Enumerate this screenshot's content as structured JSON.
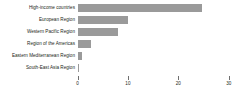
{
  "chart_data": {
    "type": "bar",
    "orientation": "horizontal",
    "title": "",
    "subtitle": "",
    "xlabel": "",
    "ylabel": "",
    "categories": [
      "High-income countries",
      "European Region",
      "Western Pacific Region",
      "Region of the Americas",
      "Eastern Mediterranean Region",
      "South-East Asia Region"
    ],
    "values": [
      24.8,
      10.0,
      8.0,
      2.7,
      0.8,
      0.3
    ],
    "series": [
      {
        "name": "",
        "values": [
          24.8,
          10.0,
          8.0,
          2.7,
          0.8,
          0.3
        ]
      }
    ],
    "xlim": [
      0,
      30.2
    ],
    "xticks": [
      0,
      10,
      20,
      30
    ],
    "xtick_labels": [
      "0",
      "10",
      "20",
      "30"
    ],
    "grid": false,
    "legend": false,
    "bar_color": "#9a9a9a",
    "text_color": "#231f20",
    "axis_color": "#6f6f6f",
    "background": "#ffffff"
  }
}
